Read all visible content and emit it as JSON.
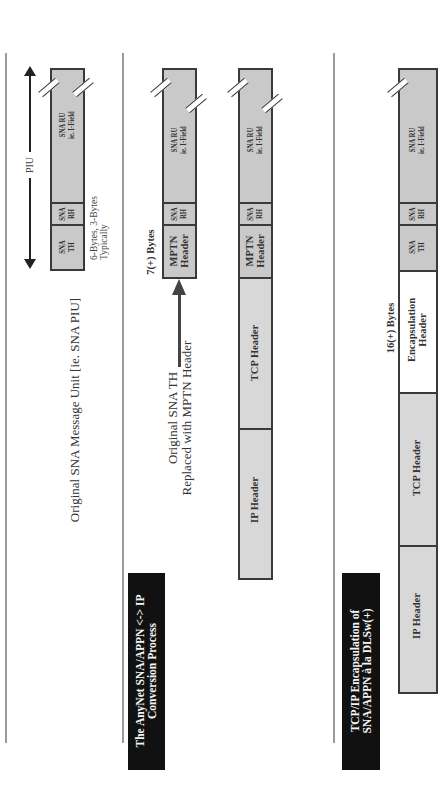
{
  "orientation": "rotated-90-ccw",
  "sections": [
    {
      "id": "original",
      "title": "Original SNA Message Unit [ie. SNA PIU]",
      "piu_label": "PIU",
      "note": [
        "6-Bytes,  3-Bytes",
        "Typically"
      ],
      "segments": [
        {
          "label": [
            "SNA RU",
            "ie. I-Field"
          ]
        },
        {
          "label": [
            "SNA",
            "RH"
          ]
        },
        {
          "label": [
            "SNA",
            "TH"
          ]
        }
      ]
    },
    {
      "id": "anynet",
      "title": [
        "The AnyNet SNA/APPN <-> IP",
        "Conversion Process"
      ],
      "bytes_label": "7(+) Bytes",
      "annotation": [
        "Original SNA TH",
        "Replaced with MPTN Header"
      ],
      "stack_a": [
        {
          "label": [
            "SNA RU",
            "ie. I-Field"
          ]
        },
        {
          "label": [
            "SNA",
            "RH"
          ]
        },
        {
          "label": [
            "MPTN",
            "Header"
          ]
        }
      ],
      "stack_b": [
        {
          "label": [
            "SNA RU",
            "ie. I-Field"
          ]
        },
        {
          "label": [
            "SNA",
            "RH"
          ]
        },
        {
          "label": [
            "MPTN",
            "Header"
          ]
        },
        {
          "label": [
            "TCP Header"
          ]
        },
        {
          "label": [
            "IP Header"
          ]
        }
      ]
    },
    {
      "id": "dlsw",
      "title": [
        "TCP/IP Encapsulation of",
        "SNA/APPN à la DLSw(+)"
      ],
      "bytes_label": "16(+) Bytes",
      "segments": [
        {
          "label": [
            "SNA RU",
            "ie. I-Field"
          ]
        },
        {
          "label": [
            "SNA",
            "RH"
          ]
        },
        {
          "label": [
            "SNA",
            "TH"
          ]
        },
        {
          "label": [
            "Encapsulation",
            "Header"
          ]
        },
        {
          "label": [
            "TCP Header"
          ]
        },
        {
          "label": [
            "IP Header"
          ]
        }
      ]
    }
  ],
  "colors": {
    "segment_fill": "#c9c9c9",
    "segment_border": "#3a3a3a",
    "title_bg": "#111111",
    "title_text": "#f4f4f4",
    "divider": "#9a9a9a"
  }
}
